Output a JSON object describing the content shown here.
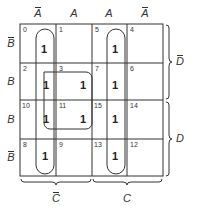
{
  "diagram": {
    "type": "karnaugh-map",
    "column_labels": [
      {
        "text": "A",
        "bar": true
      },
      {
        "text": "A",
        "bar": false
      },
      {
        "text": "A",
        "bar": false
      },
      {
        "text": "A",
        "bar": true
      }
    ],
    "row_labels": [
      {
        "text": "B",
        "bar": true
      },
      {
        "text": "B",
        "bar": false
      },
      {
        "text": "B",
        "bar": false
      },
      {
        "text": "B",
        "bar": true
      }
    ],
    "bottom_braces": [
      {
        "text": "C",
        "bar": true
      },
      {
        "text": "C",
        "bar": false
      }
    ],
    "right_braces": [
      {
        "text": "D",
        "bar": true
      },
      {
        "text": "D",
        "bar": false
      }
    ],
    "cells": [
      [
        {
          "index": "0",
          "value": "1"
        },
        {
          "index": "1",
          "value": ""
        },
        {
          "index": "5",
          "value": "1"
        },
        {
          "index": "4",
          "value": ""
        }
      ],
      [
        {
          "index": "2",
          "value": "1"
        },
        {
          "index": "3",
          "value": "1"
        },
        {
          "index": "7",
          "value": "1"
        },
        {
          "index": "6",
          "value": ""
        }
      ],
      [
        {
          "index": "10",
          "value": "1"
        },
        {
          "index": "11",
          "value": "1"
        },
        {
          "index": "15",
          "value": "1"
        },
        {
          "index": "14",
          "value": ""
        }
      ],
      [
        {
          "index": "8",
          "value": "1"
        },
        {
          "index": "9",
          "value": ""
        },
        {
          "index": "13",
          "value": "1"
        },
        {
          "index": "12",
          "value": ""
        }
      ]
    ],
    "groupings": [
      {
        "cells": [
          "0",
          "2",
          "10",
          "8"
        ],
        "shape": "vertical-loop"
      },
      {
        "cells": [
          "2",
          "3",
          "10",
          "11"
        ],
        "shape": "square-loop"
      },
      {
        "cells": [
          "5",
          "7",
          "15",
          "13"
        ],
        "shape": "vertical-loop"
      }
    ]
  }
}
